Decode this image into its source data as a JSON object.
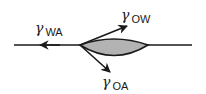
{
  "diagram": {
    "colors": {
      "line": "#1a1a1a",
      "lens_fill": "#b3b3b3",
      "background": "#ffffff"
    },
    "interface_line": {
      "x1": 14,
      "y1": 45,
      "x2": 192,
      "y2": 45
    },
    "lens": {
      "left_tip": [
        80,
        45
      ],
      "right_tip": [
        148,
        45
      ],
      "top_y": 40,
      "bottom_y": 58
    },
    "vectors": [
      {
        "id": "wa",
        "symbol": "γ",
        "subscript": "WA",
        "meaning": "water-air surface tension",
        "from": [
          80,
          45
        ],
        "to": [
          40,
          45
        ]
      },
      {
        "id": "ow",
        "symbol": "γ",
        "subscript": "OW",
        "meaning": "oil-water interfacial tension",
        "from": [
          80,
          45
        ],
        "to": [
          127,
          26
        ]
      },
      {
        "id": "oa",
        "symbol": "γ",
        "subscript": "OA",
        "meaning": "oil-air surface tension",
        "from": [
          80,
          45
        ],
        "to": [
          110,
          72
        ]
      }
    ],
    "labels": {
      "wa": {
        "symbol": "γ",
        "subscript": "WA"
      },
      "ow": {
        "symbol": "γ",
        "subscript": "OW"
      },
      "oa": {
        "symbol": "γ",
        "subscript": "OA"
      }
    }
  }
}
